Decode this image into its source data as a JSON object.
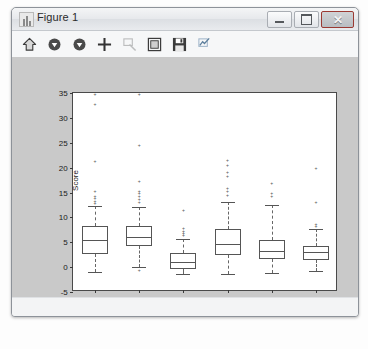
{
  "window": {
    "title": "Figure 1",
    "icon": "matplotlib-icon",
    "buttons": {
      "minimize": "minimize",
      "maximize": "maximize",
      "close": "✕"
    }
  },
  "toolbar": {
    "items": [
      {
        "name": "home-icon",
        "label": "Home",
        "enabled": true
      },
      {
        "name": "back-arrow-icon",
        "label": "Back",
        "enabled": true
      },
      {
        "name": "forward-arrow-icon",
        "label": "Forward",
        "enabled": true
      },
      {
        "name": "pan-icon",
        "label": "Pan",
        "enabled": true
      },
      {
        "name": "zoom-icon",
        "label": "Zoom to rectangle",
        "enabled": false
      },
      {
        "name": "configure-subplots-icon",
        "label": "Configure subplots",
        "enabled": true
      },
      {
        "name": "save-icon",
        "label": "Save the figure",
        "enabled": true
      },
      {
        "name": "edit-curves-icon",
        "label": "Edit axis, curve and image parameters",
        "enabled": true
      }
    ]
  },
  "chart_data": {
    "type": "box",
    "title": "",
    "xlabel": "Attribute",
    "ylabel": "Score",
    "categories": [
      "1",
      "2",
      "3",
      "4",
      "5",
      "6"
    ],
    "xticklabels": [
      "1",
      "2",
      "3",
      "4",
      "5",
      "6"
    ],
    "yticklabels": [
      "-5",
      "0",
      "5",
      "10",
      "15",
      "20",
      "25",
      "30",
      "35"
    ],
    "yticks": [
      -5,
      0,
      5,
      10,
      15,
      20,
      25,
      30,
      35
    ],
    "ylim": [
      -5,
      35
    ],
    "xlim": [
      0.5,
      6.5
    ],
    "grid": false,
    "legend": null,
    "boxes": [
      {
        "category": "1",
        "whisker_low": -1.0,
        "q1": 2.7,
        "median": 5.5,
        "q3": 8.3,
        "whisker_high": 12.2,
        "outliers": [
          12.8,
          13.3,
          13.8,
          14.3,
          15.3,
          21.4,
          32.8,
          35.0
        ]
      },
      {
        "category": "2",
        "whisker_low": 0.0,
        "q1": 4.3,
        "median": 6.0,
        "q3": 8.2,
        "whisker_high": 12.0,
        "outliers": [
          -0.6,
          13.0,
          13.6,
          14.2,
          14.8,
          15.4,
          17.3,
          24.6,
          35.0
        ]
      },
      {
        "category": "3",
        "whisker_low": -1.3,
        "q1": -0.4,
        "median": 1.1,
        "q3": 2.9,
        "whisker_high": 5.7,
        "outliers": [
          6.4,
          6.9,
          7.3,
          7.8,
          11.4
        ]
      },
      {
        "category": "4",
        "whisker_low": -1.4,
        "q1": 2.4,
        "median": 4.6,
        "q3": 7.6,
        "whisker_high": 13.0,
        "outliers": [
          14.4,
          15.4,
          16.0,
          18.4,
          19.2,
          20.5,
          21.5
        ]
      },
      {
        "category": "5",
        "whisker_low": -1.2,
        "q1": 1.6,
        "median": 3.2,
        "q3": 5.4,
        "whisker_high": 12.5,
        "outliers": [
          14.2,
          15.0,
          17.0
        ]
      },
      {
        "category": "6",
        "whisker_low": -0.8,
        "q1": 1.5,
        "median": 3.0,
        "q3": 4.3,
        "whisker_high": 7.6,
        "outliers": [
          8.2,
          8.6,
          13.0,
          20.0
        ]
      }
    ]
  }
}
